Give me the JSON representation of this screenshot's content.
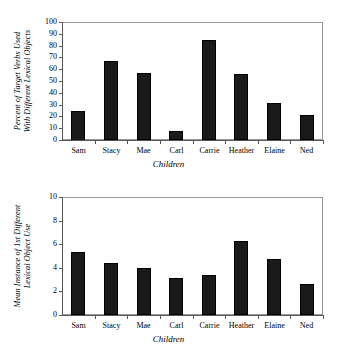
{
  "figure": {
    "background": "#ffffff",
    "bar_color": "#1a1a1a",
    "axis_color": "#585858",
    "frame_color": "#9a9a9a"
  },
  "chart_data": [
    {
      "type": "bar",
      "id": "percent-target-verbs",
      "title": "",
      "categories": [
        "Sam",
        "Stacy",
        "Mae",
        "Carl",
        "Carrie",
        "Heather",
        "Elaine",
        "Ned"
      ],
      "values": [
        25,
        67,
        57,
        8,
        85,
        56,
        31,
        21
      ],
      "xlabel": "Children",
      "ylabel": "Percent of Target Verbs Used With Different Lexical Objects",
      "ylabel_line1": "Percent of Target Verbs Used",
      "ylabel_line2": "With Different Lexical Objects",
      "ylim": [
        0,
        100
      ],
      "yticks": [
        0,
        10,
        20,
        30,
        40,
        50,
        60,
        70,
        80,
        90,
        100
      ],
      "ytick_labels": [
        "0",
        "10",
        "20",
        "30",
        "40",
        "50",
        "60",
        "70",
        "80",
        "90",
        "100"
      ],
      "grid": false,
      "legend": "none"
    },
    {
      "type": "bar",
      "id": "mean-instance-first-use",
      "title": "",
      "categories": [
        "Sam",
        "Stacy",
        "Mae",
        "Carl",
        "Carrie",
        "Heather",
        "Elaine",
        "Ned"
      ],
      "values": [
        5.3,
        4.4,
        4.0,
        3.1,
        3.35,
        6.3,
        4.75,
        2.6
      ],
      "xlabel": "Children",
      "ylabel": "Mean Instance of 1st Different Lexical Object Use",
      "ylabel_line1": "Mean Instance of 1st Different",
      "ylabel_line2": "Lexical Object Use",
      "ylim": [
        0,
        10
      ],
      "yticks": [
        0,
        2,
        4,
        6,
        8,
        10
      ],
      "ytick_labels": [
        "0",
        "2",
        "4",
        "6",
        "8",
        "10"
      ],
      "grid": false,
      "legend": "none"
    }
  ]
}
